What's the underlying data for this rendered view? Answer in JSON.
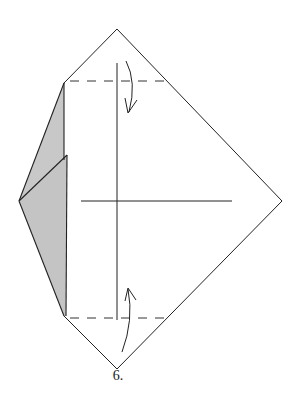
{
  "diagram": {
    "type": "origami-fold-step",
    "step_label": "6.",
    "colors": {
      "line": "#222222",
      "shaded_flap": "#c8c8c8",
      "paper": "#ffffff"
    },
    "elements": {
      "outline": "kite-shaped folded paper outline",
      "shaded_flaps": "two layered gray flaps on the left side",
      "top_valley_fold": "dashed valley fold line near top",
      "bottom_valley_fold": "dashed valley fold line near bottom",
      "top_fold_arrow": "curved arrow folding top point down",
      "bottom_fold_arrow": "curved arrow folding bottom point up",
      "center_vertical_line": "vertical crease line",
      "center_horizontal_line": "horizontal crease line"
    }
  }
}
